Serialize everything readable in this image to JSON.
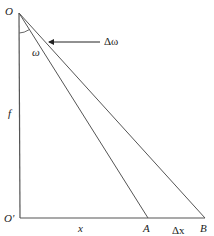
{
  "diagram": {
    "type": "geometry",
    "points": {
      "O": {
        "label": "O",
        "x": 19,
        "y": 13
      },
      "O_prime": {
        "label": "O'",
        "x": 20,
        "y": 218
      },
      "A": {
        "label": "A",
        "x": 148,
        "y": 218
      },
      "B": {
        "label": "B",
        "x": 205,
        "y": 218
      }
    },
    "labels": {
      "O": "O",
      "O_prime": "O'",
      "A": "A",
      "B": "B",
      "f": "f",
      "x": "x",
      "delta_x": "Δx",
      "omega": "ω",
      "delta_omega": "Δω"
    },
    "segments": [
      {
        "from": "O",
        "to": "O_prime",
        "meaning": "f (vertical)"
      },
      {
        "from": "O_prime",
        "to": "B",
        "meaning": "baseline through A"
      },
      {
        "from": "O",
        "to": "A"
      },
      {
        "from": "O",
        "to": "B"
      }
    ],
    "annotations": {
      "angle_omega": "angle between OO' and OA",
      "arrow_delta_omega": "arrow pointing to small angle between OA and OB"
    },
    "colors": {
      "line": "#555555",
      "text": "#222222",
      "background": "#ffffff"
    }
  }
}
